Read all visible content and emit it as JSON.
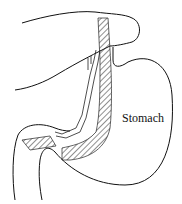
{
  "figure": {
    "type": "anatomical line drawing",
    "labels": {
      "stomach": "Stomach"
    },
    "colors": {
      "line": "#111111",
      "background": "#ffffff"
    }
  }
}
